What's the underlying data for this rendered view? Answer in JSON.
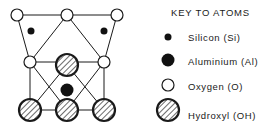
{
  "key": {
    "title": "KEY TO ATOMS",
    "items": [
      {
        "label": "Silicon (Si)",
        "symbol": "small-black-dot"
      },
      {
        "label": "Aluminium (Al)",
        "symbol": "large-black-dot"
      },
      {
        "label": "Oxygen (O)",
        "symbol": "small-open-circle"
      },
      {
        "label": "Hydroxyl (OH)",
        "symbol": "large-hatched-circle"
      }
    ]
  },
  "diagram": {
    "atoms": {
      "oxygen": [
        [
          17,
          15
        ],
        [
          67,
          15
        ],
        [
          117,
          15
        ],
        [
          30,
          62
        ],
        [
          104,
          62
        ]
      ],
      "silicon": [
        [
          31,
          31
        ],
        [
          104,
          31
        ]
      ],
      "aluminium": [
        [
          67,
          90
        ]
      ],
      "hydroxyl": [
        [
          67,
          65
        ],
        [
          30,
          110
        ],
        [
          67,
          110
        ],
        [
          104,
          110
        ]
      ]
    }
  },
  "colors": {
    "line": "#1a1a1a",
    "fill_dark": "#111111",
    "background": "#ffffff"
  }
}
